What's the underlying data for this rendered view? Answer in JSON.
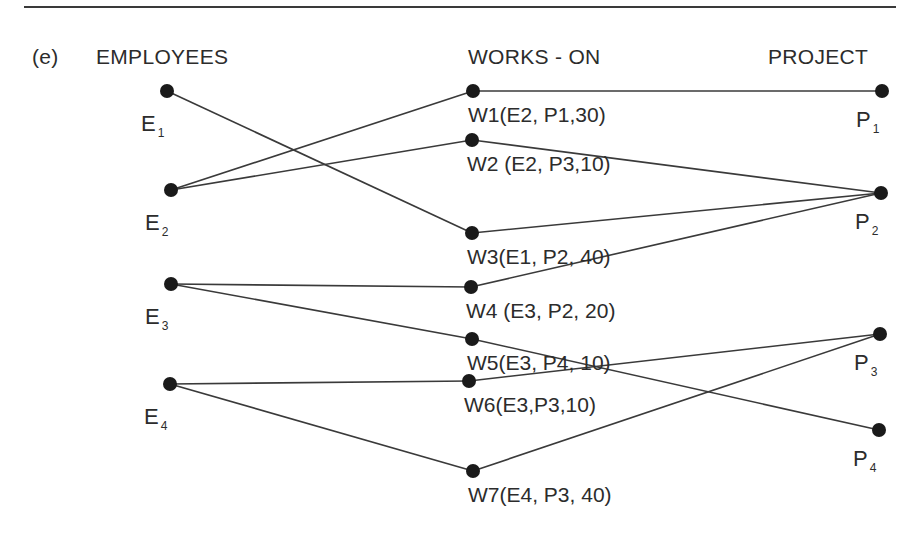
{
  "figure": {
    "part_label": "(e)",
    "columns": {
      "employees": "EMPLOYEES",
      "works_on": "WORKS - ON",
      "project": "PROJECT"
    },
    "colors": {
      "line": "#3a3a3a",
      "node": "#1a1a1a",
      "rule": "#3a3a3a"
    }
  },
  "nodes": {
    "employees": [
      {
        "id": "E1",
        "letter": "E",
        "sub": "1",
        "x": 167,
        "y": 91
      },
      {
        "id": "E2",
        "letter": "E",
        "sub": "2",
        "x": 171,
        "y": 190
      },
      {
        "id": "E3",
        "letter": "E",
        "sub": "3",
        "x": 171,
        "y": 284
      },
      {
        "id": "E4",
        "letter": "E",
        "sub": "4",
        "x": 170,
        "y": 384
      }
    ],
    "works_on": [
      {
        "id": "W1",
        "label": "W1(E2, P1,30)",
        "x": 473,
        "y": 91
      },
      {
        "id": "W2",
        "label": "W2 (E2, P3,10)",
        "x": 472,
        "y": 140
      },
      {
        "id": "W3",
        "label": "W3(E1, P2, 40)",
        "x": 472,
        "y": 233
      },
      {
        "id": "W4",
        "label": "W4 (E3, P2, 20)",
        "x": 471,
        "y": 287
      },
      {
        "id": "W5",
        "label": "W5(E3, P4, 10)",
        "x": 472,
        "y": 339
      },
      {
        "id": "W6",
        "label": "W6(E3,P3,10)",
        "x": 469,
        "y": 381
      },
      {
        "id": "W7",
        "label": "W7(E4, P3, 40)",
        "x": 473,
        "y": 471
      }
    ],
    "projects": [
      {
        "id": "P1",
        "letter": "P",
        "sub": "1",
        "x": 882,
        "y": 91
      },
      {
        "id": "P2",
        "letter": "P",
        "sub": "2",
        "x": 881,
        "y": 193
      },
      {
        "id": "P3",
        "letter": "P",
        "sub": "3",
        "x": 880,
        "y": 334
      },
      {
        "id": "P4",
        "letter": "P",
        "sub": "4",
        "x": 879,
        "y": 430
      }
    ]
  },
  "edges": [
    [
      "E1",
      "W3"
    ],
    [
      "E2",
      "W1"
    ],
    [
      "E2",
      "W2"
    ],
    [
      "E3",
      "W4"
    ],
    [
      "E3",
      "W5"
    ],
    [
      "E4",
      "W6"
    ],
    [
      "E4",
      "W7"
    ],
    [
      "W1",
      "P1"
    ],
    [
      "W2",
      "P2"
    ],
    [
      "W3",
      "P2"
    ],
    [
      "W4",
      "P2"
    ],
    [
      "W5",
      "P4"
    ],
    [
      "W6",
      "P3"
    ],
    [
      "W7",
      "P3"
    ]
  ]
}
